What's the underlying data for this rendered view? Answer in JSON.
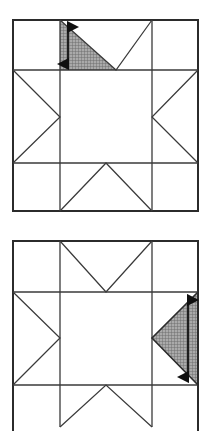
{
  "document": {
    "kind": "geometric-diagram",
    "figure_count": 2,
    "description": "Two sawtooth star quilt block diagrams, each a 3x3 grid square with corner squares, edge triangle units and a plain center square; one triangle unit is shaded and annotated with a vertical double-headed measurement arrow."
  },
  "style": {
    "background_color": "#ffffff",
    "line_color": "#3a3a3a",
    "outer_line_color": "#2b2b2b",
    "shade_fill_color": "#a8a8a8",
    "shade_hatch_color": "#6e6e6e",
    "arrow_color": "#101010",
    "outer_line_width": 2.0,
    "inner_line_width": 1.2,
    "diagonal_line_width": 1.2
  },
  "figures": [
    {
      "id": "figure-top",
      "name": "top-star-block",
      "label": "",
      "frame": {
        "x": 13,
        "y": 20,
        "width": 185,
        "height": 191
      },
      "grid": {
        "vertical_dividers": [
          60,
          152
        ],
        "horizontal_dividers": [
          70,
          163
        ],
        "columns": 3,
        "rows": 3
      },
      "cells": [
        {
          "name": "cell-top-left",
          "type": "plain-square",
          "col": 0,
          "row": 0
        },
        {
          "name": "cell-top-center",
          "type": "flying-geese-down",
          "col": 1,
          "row": 0
        },
        {
          "name": "cell-top-right",
          "type": "plain-square",
          "col": 2,
          "row": 0
        },
        {
          "name": "cell-middle-left",
          "type": "flying-geese-right",
          "col": 0,
          "row": 1
        },
        {
          "name": "cell-center",
          "type": "plain-square",
          "col": 1,
          "row": 1
        },
        {
          "name": "cell-middle-right",
          "type": "flying-geese-left",
          "col": 2,
          "row": 1
        },
        {
          "name": "cell-bottom-left",
          "type": "plain-square",
          "col": 0,
          "row": 2
        },
        {
          "name": "cell-bottom-center",
          "type": "flying-geese-up",
          "col": 1,
          "row": 2
        },
        {
          "name": "cell-bottom-right",
          "type": "plain-square",
          "col": 2,
          "row": 2
        }
      ],
      "shaded_triangle": {
        "name": "shaded-triangle-top-left-of-top-unit",
        "cell": "cell-top-center",
        "half": "left",
        "points": "60,20 116,70 60,70",
        "fill": "#a8a8a8"
      },
      "measure_arrow": {
        "name": "height-measure-arrow",
        "orientation": "vertical",
        "double_headed": true,
        "x": 68,
        "y_top": 27,
        "y_bottom": 64,
        "label": ""
      }
    },
    {
      "id": "figure-bottom",
      "name": "bottom-star-block",
      "label": "",
      "frame": {
        "x": 13,
        "y": 241,
        "width": 185,
        "height": 191
      },
      "grid": {
        "vertical_dividers": [
          60,
          152
        ],
        "horizontal_dividers": [
          292,
          385
        ],
        "columns": 3,
        "rows": 3
      },
      "cells": [
        {
          "name": "cell-top-left",
          "type": "plain-square",
          "col": 0,
          "row": 0
        },
        {
          "name": "cell-top-center",
          "type": "flying-geese-down",
          "col": 1,
          "row": 0
        },
        {
          "name": "cell-top-right",
          "type": "plain-square",
          "col": 2,
          "row": 0
        },
        {
          "name": "cell-middle-left",
          "type": "flying-geese-right",
          "col": 0,
          "row": 1
        },
        {
          "name": "cell-center",
          "type": "plain-square",
          "col": 1,
          "row": 1
        },
        {
          "name": "cell-middle-right",
          "type": "flying-geese-left",
          "col": 2,
          "row": 1
        },
        {
          "name": "cell-bottom-left",
          "type": "plain-square",
          "col": 0,
          "row": 2
        },
        {
          "name": "cell-bottom-center",
          "type": "flying-geese-up",
          "col": 1,
          "row": 2
        },
        {
          "name": "cell-bottom-right",
          "type": "plain-square",
          "col": 2,
          "row": 2
        }
      ],
      "shaded_triangle": {
        "name": "shaded-triangle-right-unit",
        "cell": "cell-middle-right",
        "half": "full-unit",
        "points": "198,292 198,385 152,338",
        "fill": "#a8a8a8"
      },
      "measure_arrow": {
        "name": "height-measure-arrow",
        "orientation": "vertical",
        "double_headed": true,
        "x": 188,
        "y_top": 300,
        "y_bottom": 377,
        "label": ""
      }
    }
  ]
}
